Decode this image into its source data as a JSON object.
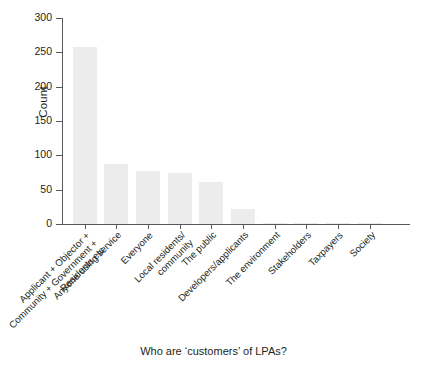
{
  "chart_data": {
    "type": "bar",
    "title": "",
    "xlabel": "Who are ‘customers’ of LPAs?",
    "ylabel": "Count",
    "ylim": [
      0,
      300
    ],
    "yticks": [
      0,
      50,
      100,
      150,
      200,
      250,
      300
    ],
    "grid": false,
    "legend": false,
    "bar_color": "#ececec",
    "axis_color": "#58595b",
    "categories": [
      "Applicant + Objector + Community + Government + Residents etc",
      "Anyone using service",
      "Everyone",
      "Local residents/ community",
      "The public",
      "Developers/applicants",
      "The environment",
      "Stakeholders",
      "Taxpayers",
      "Society"
    ],
    "category_lines": [
      [
        "Applicant + Objector +",
        "Community + Government +",
        "Residents etc"
      ],
      [
        "Anyone using service"
      ],
      [
        "Everyone"
      ],
      [
        "Local residents/",
        "community"
      ],
      [
        "The public"
      ],
      [
        "Developers/applicants"
      ],
      [
        "The environment"
      ],
      [
        "Stakeholders"
      ],
      [
        "Taxpayers"
      ],
      [
        "Society"
      ]
    ],
    "values": [
      258,
      88,
      77,
      74,
      61,
      22,
      2,
      2,
      1,
      1
    ]
  }
}
